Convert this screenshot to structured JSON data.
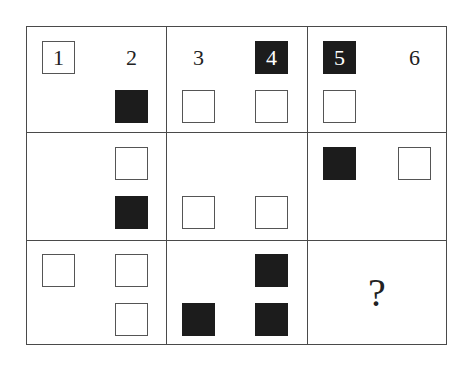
{
  "puzzle": {
    "cells": [
      {
        "id": 1,
        "slots": {
          "tl": {
            "style": "white",
            "label": "1"
          },
          "tr": {
            "style": "plain",
            "label": "2"
          },
          "br": {
            "style": "black",
            "label": ""
          }
        }
      },
      {
        "id": 2,
        "slots": {
          "tl": {
            "style": "plain",
            "label": "3"
          },
          "tr": {
            "style": "black",
            "label": "4"
          },
          "bl": {
            "style": "white",
            "label": ""
          },
          "br": {
            "style": "white",
            "label": ""
          }
        }
      },
      {
        "id": 3,
        "slots": {
          "tl": {
            "style": "black",
            "label": "5"
          },
          "tr": {
            "style": "plain",
            "label": "6"
          },
          "bl": {
            "style": "white",
            "label": ""
          }
        }
      },
      {
        "id": 4,
        "slots": {
          "tr": {
            "style": "white",
            "label": ""
          },
          "br": {
            "style": "black",
            "label": ""
          }
        }
      },
      {
        "id": 5,
        "slots": {
          "bl": {
            "style": "white",
            "label": ""
          },
          "br": {
            "style": "white",
            "label": ""
          }
        }
      },
      {
        "id": 6,
        "slots": {
          "tl": {
            "style": "black",
            "label": ""
          },
          "tr": {
            "style": "white",
            "label": ""
          }
        }
      },
      {
        "id": 7,
        "slots": {
          "tl": {
            "style": "white",
            "label": ""
          },
          "tr": {
            "style": "white",
            "label": ""
          },
          "br": {
            "style": "white",
            "label": ""
          }
        }
      },
      {
        "id": 8,
        "slots": {
          "tr": {
            "style": "black",
            "label": ""
          },
          "bl": {
            "style": "black",
            "label": ""
          },
          "br": {
            "style": "black",
            "label": ""
          }
        }
      },
      {
        "id": 9,
        "question": "?"
      }
    ]
  },
  "labels": {
    "n1": "1",
    "n2": "2",
    "n3": "3",
    "n4": "4",
    "n5": "5",
    "n6": "6",
    "question": "?"
  },
  "colors": {
    "black_square": "#1c1c1c",
    "line": "#4a4a4a",
    "background": "#ffffff"
  }
}
